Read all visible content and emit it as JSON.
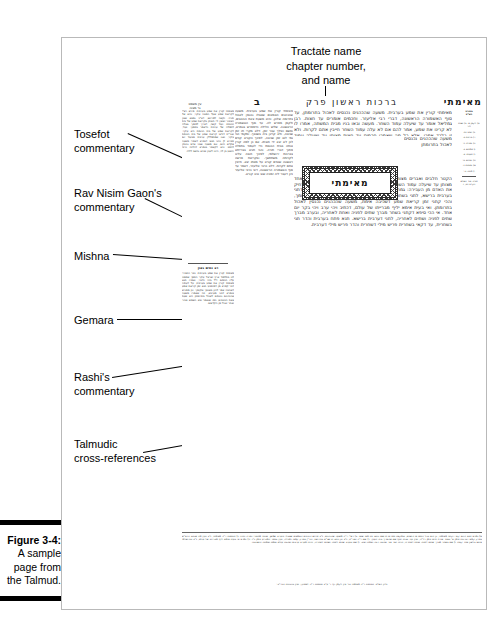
{
  "figure": {
    "number": "Figure 3-4:",
    "line1": "A sample",
    "line2": "page from",
    "line3": "the Talmud."
  },
  "top_annotation": {
    "line1": "Tractate name",
    "line2": "chapter number,",
    "line3": "and name"
  },
  "callouts": [
    {
      "id": "tosefot",
      "label": "Tosefot\ncommentary"
    },
    {
      "id": "ravnisim",
      "label": "Rav Nisim Gaon's\ncommentary"
    },
    {
      "id": "mishna",
      "label": "Mishna"
    },
    {
      "id": "gemara",
      "label": "Gemara"
    },
    {
      "id": "rashi",
      "label": "Rashi's\ncommentary"
    },
    {
      "id": "xref",
      "label": "Talmudic\ncross-references"
    }
  ],
  "talmud_page": {
    "header": {
      "tractate_word": "מאימתי",
      "chapter": "ברכות ראשון פרק",
      "folio": "ב",
      "ein_mishpat": "עין משפט\nנר מצוה"
    },
    "ornament_word": "מאימתי",
    "gemara": {
      "opening": "מאימתי קורין את שמע בערבית. משעה שהכהנים נכנסים לאכול בתרומתן, עד סוף האשמורה הראשונה, דברי רבי אליעזר. וחכמים אומרים עד חצות. רבן גמליאל אומר עד שיעלה עמוד השחר. מעשה ובאו בניו מבית המשתה, אמרו לו לא קרינו את שמע, אמר להם אם לא עלה עמוד השחר חייבין אתם לקרות. ולא זו בלבד אמרו, אלא כל מה שאמרו חכמים עד חצות מצותן עד שיעלה עמוד השחר.",
      "body": "הקטר חלבים ואברים מצותן עד שיעלה עמוד השחר, וכל הנאכלים ליום אחד מצותן עד שיעלה עמוד השחר. אם כן למה אמרו חכמים עד חצות, כדי להרחיק את האדם מן העבירה: גמרא תנא היכא קאי דקתני מאימתי, ותו מאי שנא דתני בערבית ברישא, לתני בשחרית ברישא. תנא אקרא קאי דכתיב בשכבך ובקומך, והכי קתני זמן קריאת שמע דשכיבה אימת, משעה שהכהנים נכנסין לאכול בתרומתן. ואי בעית אימא יליף מברייתו של עולם, דכתיב ויהי ערב ויהי בקר יום אחד. אי הכי סיפא דקתני בשחר מברך שתים לפניה ואחת לאחריה, ובערב מברך שתים לפניה ושתים לאחריה, לתני דערבית ברישא. תנא פתח בערבית והדר תני בשחרית, עד דקאי בשחרית פריש מילי דשחרית והדר פריש מילי דערבית."
    },
    "rashi": {
      "heading": "רש\"י",
      "text": "מאימתי קורין את שמע בערבית. משעה שהכהנים הטמאים שטבלו נכנסין לאכול בתרומה שלהן, והיא משעת צאת הכוכבים, ולקמן מפרש לה. עד סוף האשמורה הראשונה. שליש הלילה כדמפרש בגמרא, ומשם ואילך עבר זמן, דלא מקרי תו זמן שכיבה, ולא קרינן ביה בשכבך. ומקמי הכי נמי לאו זמן שכיבה, לפיכך הקורא קודם לכן לא יצא ידי חובתו. אם כן למה קורין אותה בבית הכנסת כדי לעמוד בתפלה מתוך דברי תורה. והכי תניא בברייתא בברכות ירושלמי, לפיכך חובה עלינו לקרותה משתחשך. ובקריאת פרשה ראשונה שאדם קורא על מטתו יצא. חייבין אתם לקרות. דלא כרבי אליעזר, דאמר עד סוף האשמורה הראשונה, דאי כרבי אליעזר כיון דעבר ליה זמניה שוב אינו קורא."
    },
    "tosefot": {
      "heading": "תוספות",
      "text": "מאימתי קורין את שמע בערבית. פירש רש\"י דקריאת שמע שעל המטה עיקר, והיא של תורה. וקשה לפירושו, דא\"כ נמצא שאין הציבור יוצאין ידי חובתן בקריאת שמע של בית הכנסת. ועוד קשה, דצריך לסמוך גאולה לתפלה של ערבית כדאמר בסמוך. ועוד, דקריאת שמע של בית הכנסת היא עיקר. ואור\"ת דודאי קריאת שמע של בית הכנסת עיקר, ואנו שמתפללין ערבית מבעוד יום סבירא לן כהני תנאי דגמרא דאמרי משעה שקדש היום, וגם משעה שבני אדם נכנסין להסב. והא דקאמר בגמרא דהלכה כרבי יהושע בן לוי, היינו לענין שיהא נחשב לילה."
    },
    "rav_nisim_gaon": {
      "heading": "רב נסים גאון",
      "text": "מאימתי קורין את שמע בערבית. כבר התברר לנו בתלמוד ארץ ישראל עיקר הסמך שסמכו עליו חכמים ז\"ל בזה הדבר, ואמרו תנא מאימתי קורין את שמע בערבית, על דעתיה דבר קפרא מן דמיתבעי תנא זמן קריאת שמע דשכיבה אמר להון בשכבך ובקומך. וכן מפורש בגמרא דבני מערבא, וזה שאמרו משעה שהכהנים נכנסים לאכול בתרומתן היא שעת צאת הכוכבים, כמו שנאמר ובא השמש וטהר ואחר יאכל מן הקדשים."
    },
    "marginal_notes": {
      "heading": "מסורת\nהש\"ס",
      "notes": [
        "א) לקמן ט. ב) שבת לה:",
        "ג) יומא כח.",
        "ד) ברכות ב.",
        "ה) מגילה כ:",
        "ו) פסחים ב.",
        "ז) תענית יב.",
        "ח) זבחים נו:",
        "ט) מנחות כ.",
        "י) סוכה נד:"
      ],
      "footer": "תורה אור השלם\nויקרא כב, ז"
    },
    "bottom_block": {
      "heading": "הגהות הב\"ח",
      "text": "א) גמרא תנא היכא קאי דקתני מאימתי, כן הוא בכל הספרים הישנים, ובמקצת ספרים חדשים כתוב ותו מאי שנא. ב) רש\"י ד\"ה משעה שהכהנים, נ\"ב פירוש הכהנים הטמאים שטבלו והעריב שמשן, ואכתי מחוסרי כפרה נינהו. ג) תוספות ד\"ה מאימתי, נ\"ב ועיין מה שכתב הרא\"ש בפרק קמא דברכות סימן א' ובטור אורח חיים סימן רל\"ה, ועיין עוד בבית יוסף שם שהאריך בזה הענין. ד) שם ד\"ה ואור\"ת, נ\"ב וכן כתב הרשב\"א בחידושיו, והר\"ן בפרק קמא דמגילה, ועיין בספר המכריע סימן כ\"ו. ה) גמרא אי בעית אימא יליף מברייתו של עולם, נ\"ב ובירושלמי איתא בלשון אחר קצת. ו) שם בשחר מברך שתים לפניה ואחת לאחריה, והיינו יוצר אור ואהבה רבה ואמת ויציב. ז) שם ובערב שתים לפניה ושתים לאחריה, והיינו מעריב ערבים ואהבת עולם ואמת ואמונה והשכיבנו.",
      "last_line": "גליון הש\"ס. תוספות ד\"ה מאימתי וכו' עיין לקמן דף ד' ע\"ב תוספות ד\"ה לאפוקי, ועיין בהגהות הגרי\"ב:"
    }
  }
}
